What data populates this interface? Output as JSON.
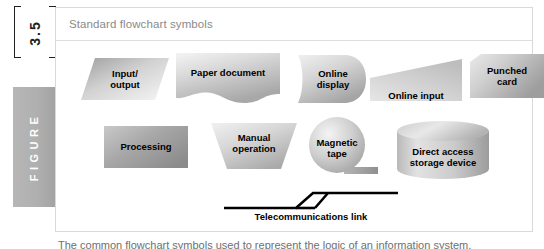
{
  "figure": {
    "number": "3.5",
    "tab_label": "FIGURE"
  },
  "panel": {
    "title": "Standard flowchart symbols"
  },
  "colors": {
    "shape_fill_light": "#f2f2f2",
    "shape_fill_mid": "#cdcdcd",
    "shape_fill_dark": "#9a9a9a",
    "text": "#000000",
    "panel_border": "#d9d9d9",
    "title_text": "#8a8a8a",
    "tab_bg": "#b0b0b0",
    "tab_text": "#ffffff"
  },
  "symbols": {
    "row1": [
      {
        "id": "input-output",
        "label": "Input/\noutput",
        "shape": "parallelogram"
      },
      {
        "id": "paper-document",
        "label": "Paper document",
        "shape": "document"
      },
      {
        "id": "online-display",
        "label": "Online\ndisplay",
        "shape": "display"
      },
      {
        "id": "online-input",
        "label": "Online input",
        "shape": "trapezoid"
      },
      {
        "id": "punched-card",
        "label": "Punched\ncard",
        "shape": "punched-card"
      }
    ],
    "row2": [
      {
        "id": "processing",
        "label": "Processing",
        "shape": "rectangle"
      },
      {
        "id": "manual-operation",
        "label": "Manual\noperation",
        "shape": "inverted-trapezoid"
      },
      {
        "id": "magnetic-tape",
        "label": "Magnetic\ntape",
        "shape": "circle-tail"
      },
      {
        "id": "direct-access",
        "label": "Direct access\nstorage device",
        "shape": "cylinder"
      }
    ],
    "footer": {
      "id": "telecommunications-link",
      "label": "Telecommunications link",
      "shape": "zigzag-line"
    }
  },
  "cut_caption": {
    "text": "The common flowchart symbols used to represent the logic of an information system."
  }
}
